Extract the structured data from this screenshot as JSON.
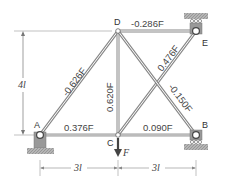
{
  "diagram": {
    "type": "truss",
    "nodes": [
      {
        "id": "A",
        "label": "A",
        "support": "pin"
      },
      {
        "id": "B",
        "label": "B",
        "support": "roller"
      },
      {
        "id": "C",
        "label": "C",
        "support": "none"
      },
      {
        "id": "D",
        "label": "D",
        "support": "none"
      },
      {
        "id": "E",
        "label": "E",
        "support": "roller-ceiling"
      }
    ],
    "members": [
      {
        "id": "AC",
        "force": "0.376F"
      },
      {
        "id": "CB",
        "force": "0.090F"
      },
      {
        "id": "AD",
        "force": "-0.626F"
      },
      {
        "id": "CD",
        "force": "0.620F"
      },
      {
        "id": "DE",
        "force": "-0.286F"
      },
      {
        "id": "CE",
        "force": "0.476F"
      },
      {
        "id": "DB",
        "force": "-0.150F"
      }
    ],
    "load": {
      "node": "C",
      "label": "F"
    },
    "dimensions": {
      "height": "4l",
      "span_left": "3l",
      "span_right": "3l"
    }
  }
}
